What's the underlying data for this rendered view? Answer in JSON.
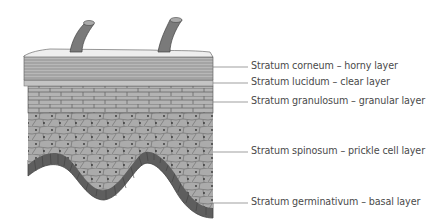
{
  "colors": {
    "hair": "#7a7a7a",
    "surface": "#eeeeee",
    "corneum": "#b5b5b5",
    "granulosum": "#b0b0b0",
    "spinosum": "#a9a9a9",
    "germinativum": "#5e5e5e",
    "outline": "#555555",
    "leader": "#777777",
    "text": "#4a4a4a"
  },
  "labels": [
    {
      "id": "corneum",
      "text": "Stratum corneum – horny layer",
      "y": 67
    },
    {
      "id": "lucidum",
      "text": "Stratum lucidum – clear layer",
      "y": 83
    },
    {
      "id": "granulosum",
      "text": "Stratum granulosum – granular layer",
      "y": 102
    },
    {
      "id": "spinosum",
      "text": "Stratum spinosum – prickle cell layer",
      "y": 152
    },
    {
      "id": "germinativum",
      "text": "Stratum germinativum – basal layer",
      "y": 203
    }
  ]
}
